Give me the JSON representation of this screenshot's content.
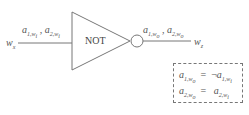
{
  "diagram": {
    "gate": {
      "label": "NOT",
      "type": "inverter"
    },
    "input": {
      "wire_label": "w",
      "wire_sub": "x",
      "signals": [
        {
          "name": "a",
          "sub": "1,w",
          "subsub": "i"
        },
        {
          "name": "a",
          "sub": "2,w",
          "subsub": "i"
        }
      ],
      "separator": ","
    },
    "output": {
      "wire_label": "w",
      "wire_sub": "z",
      "signals": [
        {
          "name": "a",
          "sub": "1,w",
          "subsub": "o"
        },
        {
          "name": "a",
          "sub": "2,w",
          "subsub": "o"
        }
      ],
      "separator": ","
    },
    "equations": [
      {
        "lhs": "a",
        "lhs_sub": "1,w",
        "lhs_subsub": "o",
        "op": "=",
        "neg": "¬",
        "rhs": "a",
        "rhs_sub": "1,w",
        "rhs_subsub": "i"
      },
      {
        "lhs": "a",
        "lhs_sub": "2,w",
        "lhs_subsub": "o",
        "op": "=",
        "neg": "",
        "rhs": "a",
        "rhs_sub": "2,w",
        "rhs_subsub": "i"
      }
    ],
    "colors": {
      "stroke": "#666666",
      "text": "#555555",
      "dash": "#777777"
    }
  }
}
